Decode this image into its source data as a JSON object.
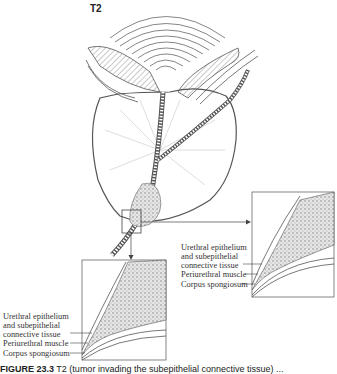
{
  "figure": {
    "stage_label": "T2",
    "caption_prefix": "FIGURE 23.3",
    "caption_rest": "  T2 (tumor invading the subepithelial connective tissue) ..."
  },
  "insets": {
    "right": {
      "labels": [
        "Urethral epithelium",
        "and subepithelial",
        "connective tissue",
        "Periurethral muscle",
        "Corpus spongiosum"
      ]
    },
    "bottom_left": {
      "labels": [
        "Urethral epithelium",
        "and subepithelial",
        "connective tissue",
        "Periurethral muscle",
        "Corpus spongiosum"
      ]
    }
  },
  "colors": {
    "line": "#555555",
    "tumor": "#8a8a8a",
    "text": "#333333"
  }
}
